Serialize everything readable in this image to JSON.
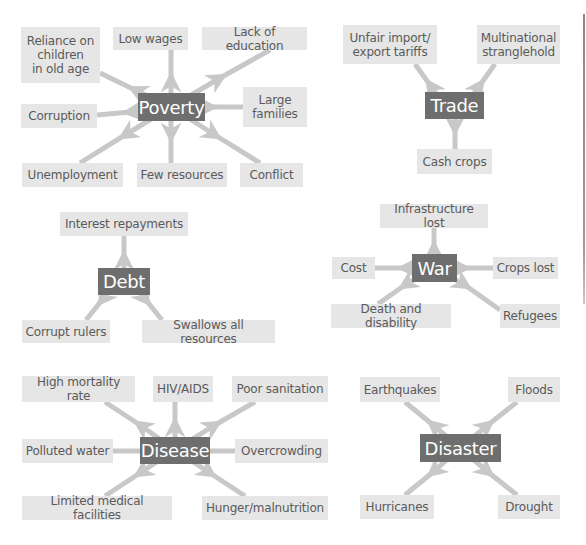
{
  "colors": {
    "hub_bg": "#6e6e6e",
    "leaf_bg": "#e6e6e6",
    "leaf_text": "#5a5a5a",
    "arrow": "#c8c8c8"
  },
  "diagrams": {
    "poverty": {
      "hub": "Poverty",
      "leaves": {
        "reliance": "Reliance on\nchildren\nin old age",
        "low_wages": "Low wages",
        "lack_education": "Lack of education",
        "corruption": "Corruption",
        "large_families": "Large\nfamilies",
        "unemployment": "Unemployment",
        "few_resources": "Few resources",
        "conflict": "Conflict"
      }
    },
    "trade": {
      "hub": "Trade",
      "leaves": {
        "unfair_tariffs": "Unfair import/\nexport tariffs",
        "multinational": "Multinational\nstranglehold",
        "cash_crops": "Cash crops"
      }
    },
    "debt": {
      "hub": "Debt",
      "leaves": {
        "interest": "Interest repayments",
        "corrupt_rulers": "Corrupt rulers",
        "swallows": "Swallows all resources"
      }
    },
    "war": {
      "hub": "War",
      "leaves": {
        "infrastructure": "Infrastructure lost",
        "cost": "Cost",
        "crops_lost": "Crops lost",
        "death": "Death and disability",
        "refugees": "Refugees"
      }
    },
    "disease": {
      "hub": "Disease",
      "leaves": {
        "mortality": "High mortality rate",
        "hiv": "HIV/AIDS",
        "sanitation": "Poor sanitation",
        "polluted_water": "Polluted water",
        "overcrowding": "Overcrowding",
        "medical": "Limited medical facilities",
        "hunger": "Hunger/malnutrition"
      }
    },
    "disaster": {
      "hub": "Disaster",
      "leaves": {
        "earthquakes": "Earthquakes",
        "floods": "Floods",
        "hurricanes": "Hurricanes",
        "drought": "Drought"
      }
    }
  }
}
